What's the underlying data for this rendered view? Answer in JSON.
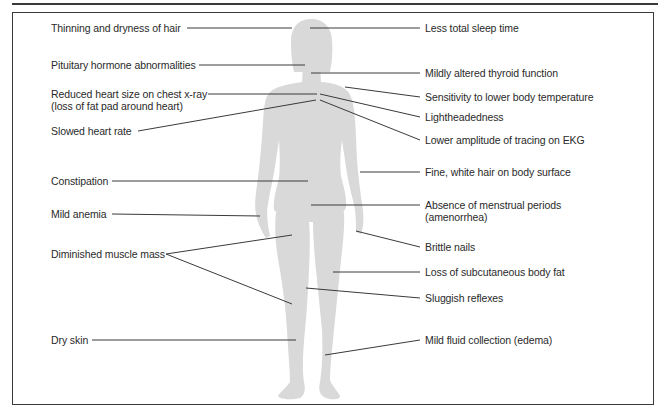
{
  "figure": {
    "silhouette_color": "#d9d9d9",
    "line_color": "#3a3a3a",
    "text_color": "#2a2a2a"
  },
  "left_labels": [
    {
      "id": "hair",
      "lines": [
        "Thinning and dryness of hair"
      ]
    },
    {
      "id": "pituitary",
      "lines": [
        "Pituitary hormone abnormalities"
      ]
    },
    {
      "id": "heart_size",
      "lines": [
        "Reduced heart size on chest x-ray",
        "(loss of fat pad around heart)"
      ]
    },
    {
      "id": "heart_rate",
      "lines": [
        "Slowed heart rate"
      ]
    },
    {
      "id": "constipation",
      "lines": [
        "Constipation"
      ]
    },
    {
      "id": "anemia",
      "lines": [
        "Mild anemia"
      ]
    },
    {
      "id": "muscle",
      "lines": [
        "Diminished muscle mass"
      ]
    },
    {
      "id": "dry_skin",
      "lines": [
        "Dry skin"
      ]
    }
  ],
  "right_labels": [
    {
      "id": "sleep",
      "lines": [
        "Less total sleep time"
      ]
    },
    {
      "id": "thyroid",
      "lines": [
        "Mildly altered thyroid function"
      ]
    },
    {
      "id": "temperature",
      "lines": [
        "Sensitivity to lower body temperature"
      ]
    },
    {
      "id": "lightheaded",
      "lines": [
        "Lightheadedness"
      ]
    },
    {
      "id": "ekg",
      "lines": [
        "Lower amplitude of tracing on EKG"
      ]
    },
    {
      "id": "body_hair",
      "lines": [
        "Fine, white hair on body surface"
      ]
    },
    {
      "id": "menstrual",
      "lines": [
        "Absence of menstrual periods",
        "(amenorrhea)"
      ]
    },
    {
      "id": "nails",
      "lines": [
        "Brittle nails"
      ]
    },
    {
      "id": "body_fat",
      "lines": [
        "Loss of subcutaneous body fat"
      ]
    },
    {
      "id": "reflexes",
      "lines": [
        "Sluggish reflexes"
      ]
    },
    {
      "id": "edema",
      "lines": [
        "Mild fluid collection (edema)"
      ]
    }
  ]
}
